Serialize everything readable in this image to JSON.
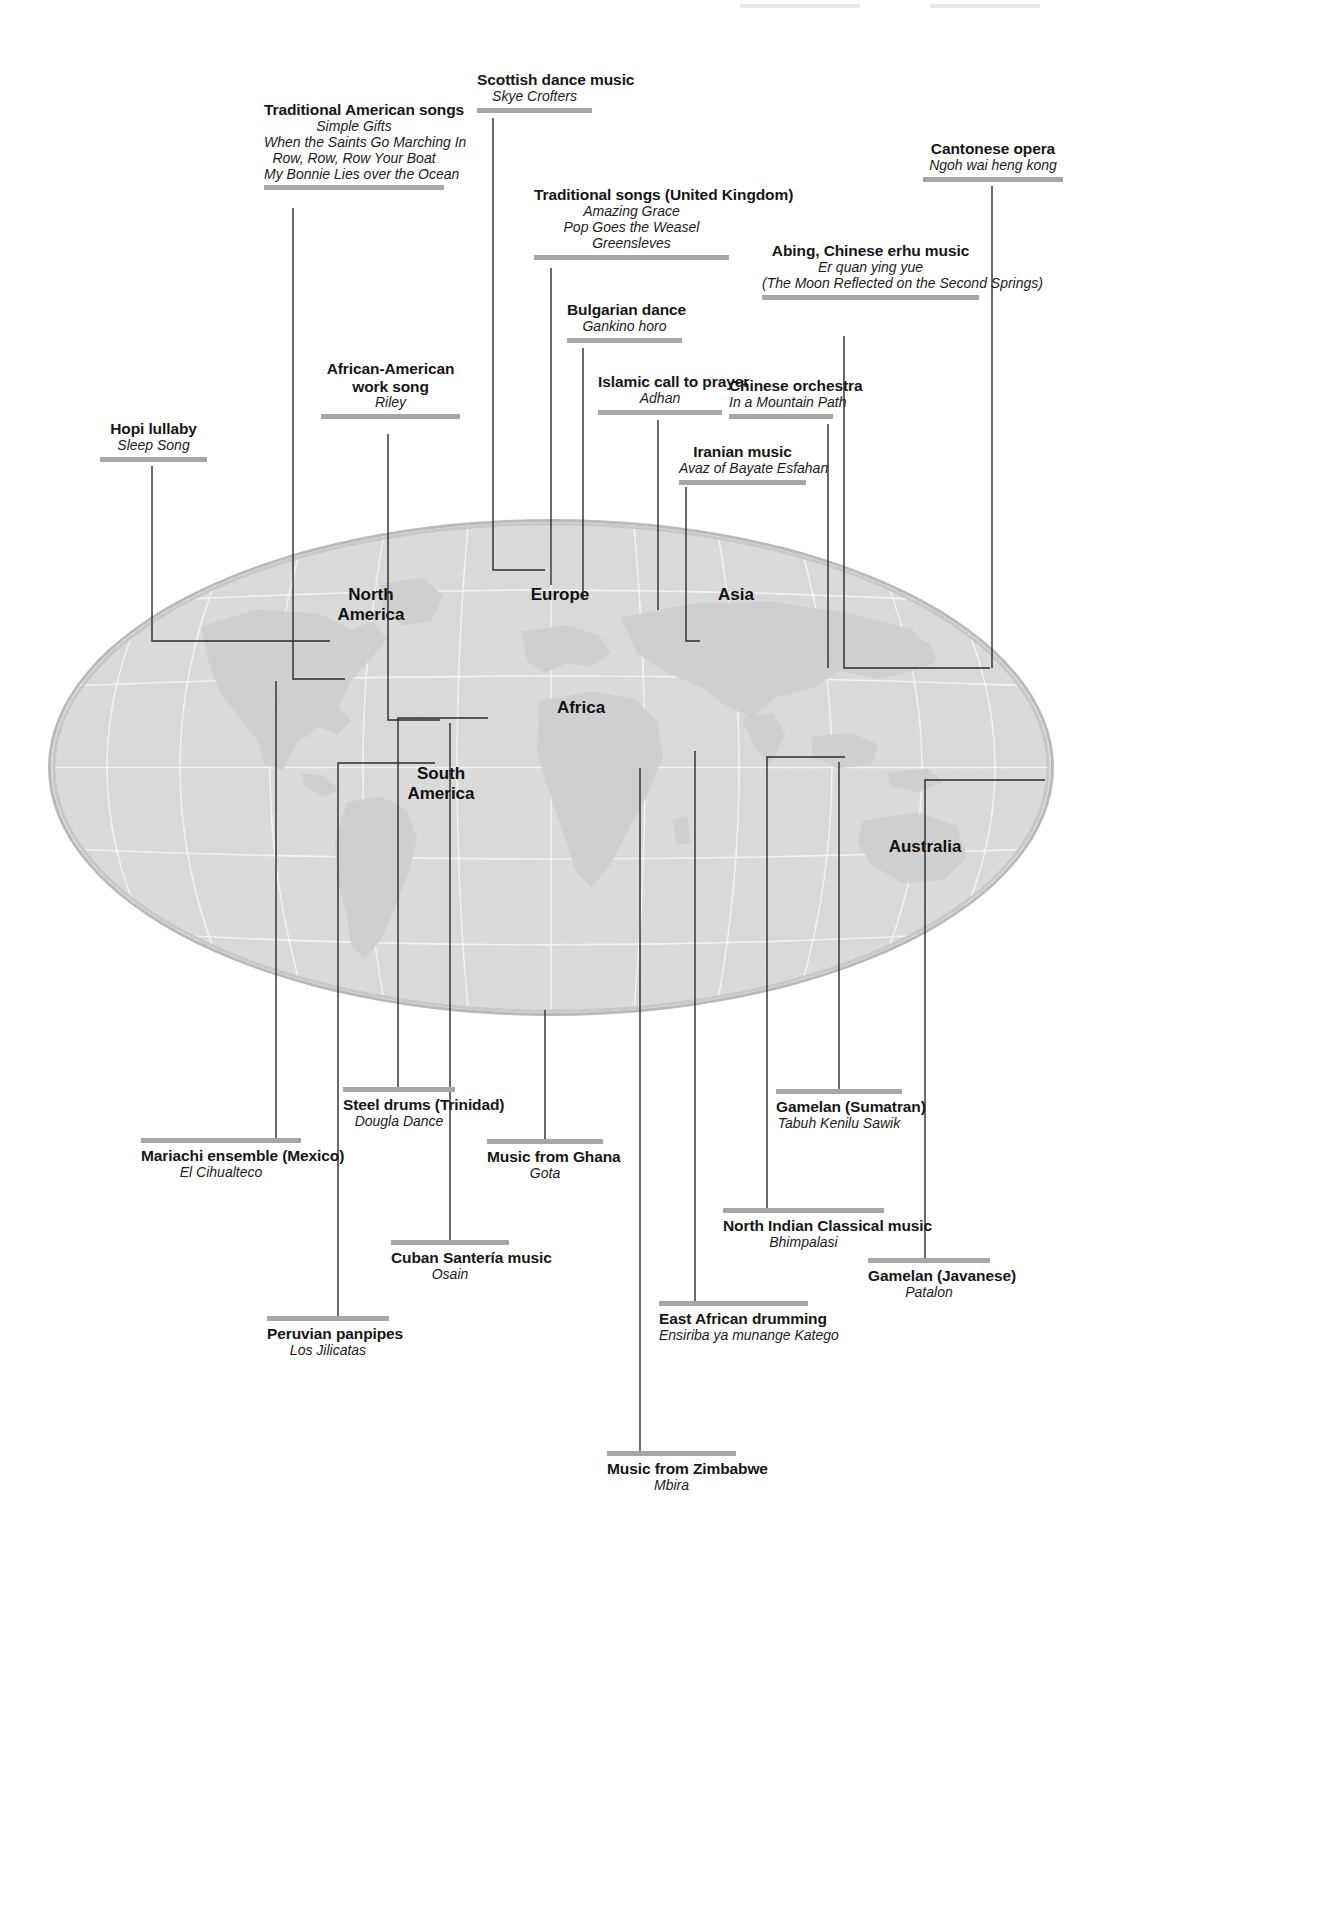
{
  "figure": {
    "kind": "world-music-map",
    "projection": "elliptical",
    "globe_fill": "#dedede",
    "rule_color": "#a6a6a6",
    "leader_color": "#2b2b2b"
  },
  "continents": [
    {
      "name": "north-america",
      "label": "North\nAmerica"
    },
    {
      "name": "south-america",
      "label": "South\nAmerica"
    },
    {
      "name": "europe",
      "label": "Europe"
    },
    {
      "name": "africa",
      "label": "Africa"
    },
    {
      "name": "asia",
      "label": "Asia"
    },
    {
      "name": "australia",
      "label": "Australia"
    }
  ],
  "callouts": [
    {
      "id": "hopi-lullaby",
      "title": "Hopi lullaby",
      "pieces": [
        "Sleep Song"
      ]
    },
    {
      "id": "traditional-american-songs",
      "title": "Traditional American songs",
      "pieces": [
        "Simple Gifts",
        "When the Saints Go Marching In",
        "Row, Row, Row Your Boat",
        "My Bonnie Lies over the Ocean"
      ]
    },
    {
      "id": "african-american-work-song",
      "title": "African-American work song",
      "pieces": [
        "Riley"
      ]
    },
    {
      "id": "scottish-dance-music",
      "title": "Scottish dance music",
      "pieces": [
        "Skye Crofters"
      ]
    },
    {
      "id": "traditional-songs-united-kingdom",
      "title": "Traditional songs (United Kingdom)",
      "pieces": [
        "Amazing Grace",
        "Pop Goes the Weasel",
        "Greensleves"
      ]
    },
    {
      "id": "bulgarian-dance",
      "title": "Bulgarian dance",
      "pieces": [
        "Gankino horo"
      ]
    },
    {
      "id": "islamic-call-to-prayer",
      "title": "Islamic call to prayer",
      "pieces": [
        "Adhan"
      ]
    },
    {
      "id": "chinese-orchestra",
      "title": "Chinese orchestra",
      "pieces": [
        "In a Mountain Path"
      ]
    },
    {
      "id": "iranian-music",
      "title": "Iranian music",
      "pieces": [
        "Avaz of Bayate Esfahan"
      ]
    },
    {
      "id": "abing-chinese-erhu-music",
      "title": "Abing, Chinese erhu music",
      "pieces": [
        "Er quan ying yue",
        "(The Moon Reflected on the Second Springs)"
      ]
    },
    {
      "id": "cantonese-opera",
      "title": "Cantonese opera",
      "pieces": [
        "Ngoh wai heng kong"
      ]
    },
    {
      "id": "steel-drums-trinidad",
      "title": "Steel drums (Trinidad)",
      "pieces": [
        "Dougla Dance"
      ]
    },
    {
      "id": "mariachi-ensemble-mexico",
      "title": "Mariachi ensemble (Mexico)",
      "pieces": [
        "El Cihualteco"
      ]
    },
    {
      "id": "music-from-ghana",
      "title": "Music from Ghana",
      "pieces": [
        "Gota"
      ]
    },
    {
      "id": "gamelan-sumatran",
      "title": "Gamelan (Sumatran)",
      "pieces": [
        "Tabuh Kenilu Sawik"
      ]
    },
    {
      "id": "cuban-santeria-music",
      "title": "Cuban Santería music",
      "pieces": [
        "Osain"
      ]
    },
    {
      "id": "north-indian-classical-music",
      "title": "North Indian Classical music",
      "pieces": [
        "Bhimpalasi"
      ]
    },
    {
      "id": "gamelan-javanese",
      "title": "Gamelan (Javanese)",
      "pieces": [
        "Patalon"
      ]
    },
    {
      "id": "peruvian-panpipes",
      "title": "Peruvian panpipes",
      "pieces": [
        "Los Jilicatas"
      ]
    },
    {
      "id": "east-african-drumming",
      "title": "East African drumming",
      "pieces": [
        "Ensiriba ya munange Katego"
      ]
    },
    {
      "id": "music-from-zimbabwe",
      "title": "Music from Zimbabwe",
      "pieces": [
        "Mbira"
      ]
    }
  ]
}
